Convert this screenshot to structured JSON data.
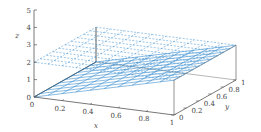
{
  "chart_data": {
    "type": "surface3d",
    "title": "",
    "xlabel": "x",
    "ylabel": "y",
    "zlabel": "z",
    "xlim": [
      0,
      1
    ],
    "ylim": [
      0,
      1
    ],
    "zlim": [
      0,
      5
    ],
    "x_ticks": [
      "0",
      "0.2",
      "0.4",
      "0.6",
      "0.8",
      "1"
    ],
    "y_ticks": [
      "0",
      "0.2",
      "0.4",
      "0.6",
      "0.8",
      "1"
    ],
    "z_ticks": [
      "0",
      "1",
      "2",
      "3",
      "4",
      "5"
    ],
    "grid": false,
    "series": [
      {
        "name": "plane z = 2x (solid mesh)",
        "style": "solid",
        "color": "#3a8fd0",
        "corners": [
          {
            "x": 0,
            "y": 0,
            "z": 0
          },
          {
            "x": 1,
            "y": 0,
            "z": 2
          },
          {
            "x": 1,
            "y": 1,
            "z": 2
          },
          {
            "x": 0,
            "y": 1,
            "z": 0
          }
        ]
      },
      {
        "name": "plane z = 2 (dashed mesh)",
        "style": "dashed",
        "color": "#3a8fd0",
        "corners": [
          {
            "x": 0,
            "y": 0,
            "z": 2
          },
          {
            "x": 1,
            "y": 0,
            "z": 2
          },
          {
            "x": 1,
            "y": 1,
            "z": 2
          },
          {
            "x": 0,
            "y": 1,
            "z": 2
          }
        ]
      }
    ],
    "mesh_divisions": 10
  }
}
